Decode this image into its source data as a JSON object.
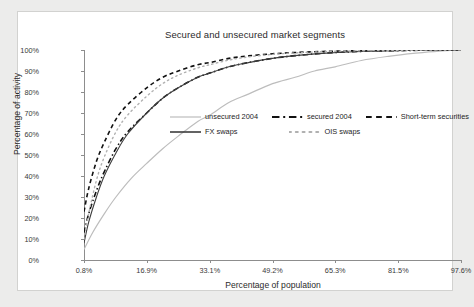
{
  "chart_data": {
    "type": "line",
    "title": "Secured and unsecured market segments",
    "xlabel": "Percentage of population",
    "ylabel": "Percentage of activity",
    "xtick_labels": [
      "0.8%",
      "16.9%",
      "33.1%",
      "49.2%",
      "65.3%",
      "81.5%",
      "97.6%"
    ],
    "xtick_values": [
      0.8,
      16.9,
      33.1,
      49.2,
      65.3,
      81.5,
      97.6
    ],
    "ytick_labels": [
      "0%",
      "10%",
      "20%",
      "30%",
      "40%",
      "50%",
      "60%",
      "70%",
      "80%",
      "90%",
      "100%"
    ],
    "ytick_values": [
      0,
      10,
      20,
      30,
      40,
      50,
      60,
      70,
      80,
      90,
      100
    ],
    "xlim": [
      0.8,
      97.6
    ],
    "ylim": [
      0,
      100
    ],
    "grid": false,
    "legend_position": "center",
    "series": [
      {
        "name": "unsecured 2004",
        "style": "solid",
        "color": "#bdbdbd",
        "width": 1.2,
        "x": [
          0.8,
          3,
          6,
          9,
          13,
          16.9,
          21,
          25,
          30,
          33.1,
          38,
          43,
          49.2,
          55,
          60,
          65.3,
          72,
          79,
          86,
          92,
          97.6
        ],
        "y": [
          5,
          13,
          22,
          30,
          39,
          46,
          53,
          59,
          66,
          69,
          75,
          79,
          84,
          87,
          90,
          92,
          95,
          97,
          98.5,
          99.5,
          100
        ]
      },
      {
        "name": "secured 2004",
        "style": "dash-dot",
        "color": "#111111",
        "width": 1.6,
        "x": [
          0.8,
          2,
          4,
          6,
          9,
          12,
          16.9,
          21,
          25,
          30,
          33.1,
          38,
          43,
          49.2,
          55,
          62,
          70,
          80,
          90,
          97.6
        ],
        "y": [
          13,
          22,
          33,
          42,
          53,
          61,
          70,
          77,
          82,
          87,
          89,
          92,
          94,
          96,
          97.3,
          98.4,
          99.2,
          99.7,
          99.9,
          100
        ]
      },
      {
        "name": "Short-term securities",
        "style": "dashed",
        "color": "#111111",
        "width": 1.6,
        "x": [
          0.8,
          2,
          4,
          6,
          9,
          12,
          16.9,
          21,
          25,
          30,
          33.1,
          38,
          43,
          49.2,
          55,
          62,
          70,
          80,
          90,
          97.6
        ],
        "y": [
          23,
          34,
          47,
          56,
          67,
          74,
          82,
          87,
          90,
          93,
          94,
          96,
          97.2,
          98.2,
          98.8,
          99.3,
          99.6,
          99.8,
          99.95,
          100
        ]
      },
      {
        "name": "FX swaps",
        "style": "solid",
        "color": "#3d3d3d",
        "width": 1.1,
        "x": [
          0.8,
          2,
          4,
          6,
          9,
          12,
          16.9,
          21,
          25,
          30,
          33.1,
          38,
          43,
          49.2,
          55,
          62,
          70,
          80,
          90,
          97.6
        ],
        "y": [
          8,
          18,
          30,
          40,
          51,
          60,
          70,
          77,
          82,
          87,
          89,
          92,
          94,
          96,
          97.3,
          98.4,
          99.2,
          99.7,
          99.9,
          100
        ]
      },
      {
        "name": "OIS swaps",
        "style": "dotted",
        "color": "#b0b0b0",
        "width": 1.4,
        "x": [
          0.8,
          2,
          4,
          6,
          9,
          12,
          16.9,
          21,
          25,
          30,
          33.1,
          38,
          43,
          49.2,
          55,
          62,
          70,
          80,
          90,
          97.6
        ],
        "y": [
          10,
          22,
          38,
          49,
          61,
          69,
          78,
          84,
          88,
          91.5,
          93,
          95.2,
          96.7,
          97.9,
          98.6,
          99.2,
          99.6,
          99.8,
          99.95,
          100
        ]
      }
    ]
  },
  "legend": {
    "rows": [
      [
        {
          "label": "unsecured 2004",
          "style": "solid",
          "color": "#bdbdbd",
          "width": 1.2
        },
        {
          "label": "secured 2004",
          "style": "dash-dot",
          "color": "#111111",
          "width": 2.2
        },
        {
          "label": "Short-term securities",
          "style": "dashed",
          "color": "#111111",
          "width": 2.2
        }
      ],
      [
        {
          "label": "FX swaps",
          "style": "solid",
          "color": "#3d3d3d",
          "width": 1.6
        },
        {
          "label": "OIS swaps",
          "style": "dotted",
          "color": "#b0b0b0",
          "width": 2.0
        }
      ]
    ]
  }
}
